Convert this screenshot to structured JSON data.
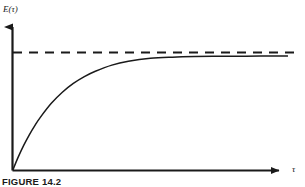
{
  "figure": {
    "caption": "FIGURE 14.2",
    "background_color": "#ffffff",
    "ink_color": "#1a1a1a"
  },
  "chart_data": {
    "type": "line",
    "title": "",
    "subtitle": "",
    "xlabel": "τ",
    "ylabel": "E(τ)",
    "grid": false,
    "legend": null,
    "axis_style": "arrow-headed open axes, no tick marks, no tick labels",
    "xlim": [
      0,
      1
    ],
    "ylim": [
      0,
      1.12
    ],
    "annotations": [
      {
        "name": "asymptote",
        "style": "dashed",
        "orientation": "horizontal",
        "y": 1.0,
        "label": ""
      }
    ],
    "series": [
      {
        "name": "E(τ)",
        "style": "solid",
        "description": "monotonically increasing saturating exponential rise from the origin, asymptotic to the dashed line",
        "x": [
          0.0,
          0.02,
          0.04,
          0.06,
          0.08,
          0.1,
          0.14,
          0.18,
          0.22,
          0.26,
          0.3,
          0.36,
          0.42,
          0.5,
          0.58,
          0.66,
          0.74,
          0.82,
          0.9,
          1.0
        ],
        "y": [
          0.0,
          0.115,
          0.218,
          0.309,
          0.39,
          0.462,
          0.585,
          0.682,
          0.759,
          0.819,
          0.866,
          0.92,
          0.954,
          0.98,
          0.99,
          0.995,
          0.997,
          0.998,
          0.999,
          0.999
        ]
      }
    ]
  },
  "labels": {
    "y_axis": "E(τ)",
    "x_axis": "τ"
  }
}
